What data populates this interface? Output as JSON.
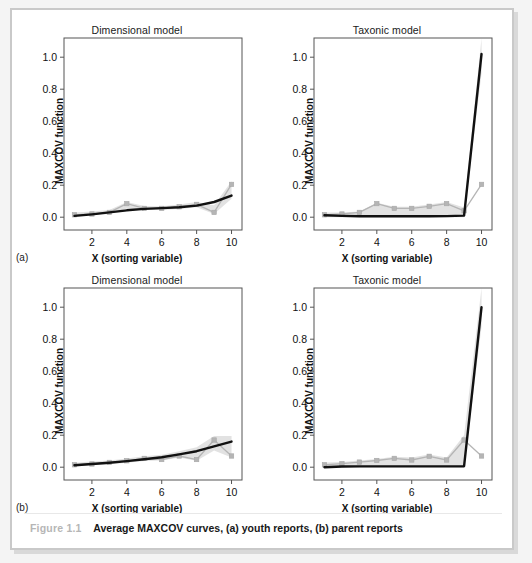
{
  "figure": {
    "number": "Figure 1.1",
    "caption": "Average MAXCOV curves, (a) youth reports, (b) parent reports",
    "panel_label_a": "(a)",
    "panel_label_b": "(b)"
  },
  "axes": {
    "ylabel": "MAXCOV function",
    "xlabel": "X (sorting variable)",
    "yticks": [
      "0.0",
      "0.2",
      "0.4",
      "0.6",
      "0.8",
      "1.0"
    ],
    "ytick_values": [
      0.0,
      0.2,
      0.4,
      0.6,
      0.8,
      1.0
    ],
    "xticks": [
      "2",
      "4",
      "6",
      "8",
      "10"
    ],
    "xtick_values": [
      2,
      4,
      6,
      8,
      10
    ],
    "xlim": [
      0.4,
      10.6
    ],
    "ylim": [
      -0.08,
      1.12
    ]
  },
  "colors": {
    "observed_line": "#b5b5b5",
    "model_line": "#111111",
    "band": "#dddddd",
    "frame": "#555555",
    "page_bg": "#f4f4f4",
    "sheet_bg": "#ffffff",
    "fig_number": "#b6b6b6"
  },
  "chart_data": [
    {
      "id": "a-dimensional",
      "type": "line",
      "title": "Dimensional model",
      "panel": "(a)",
      "xlabel": "X (sorting variable)",
      "ylabel": "MAXCOV function",
      "xlim": [
        0.4,
        10.6
      ],
      "ylim": [
        -0.08,
        1.12
      ],
      "grid": false,
      "legend": "none",
      "x": [
        1,
        2,
        3,
        4,
        5,
        6,
        7,
        8,
        9,
        10
      ],
      "series": [
        {
          "name": "Observed average MAXCOV curve",
          "style": "gray-line-with-square-markers",
          "values": [
            0.015,
            0.02,
            0.03,
            0.085,
            0.055,
            0.055,
            0.065,
            0.08,
            0.03,
            0.205
          ]
        },
        {
          "name": "Fitted dimensional model",
          "style": "black-line",
          "values": [
            0.008,
            0.018,
            0.03,
            0.043,
            0.052,
            0.057,
            0.062,
            0.072,
            0.095,
            0.135
          ]
        }
      ],
      "band": {
        "name": "confidence band",
        "upper": [
          0.03,
          0.035,
          0.045,
          0.095,
          0.07,
          0.068,
          0.08,
          0.095,
          0.075,
          0.225
        ],
        "lower": [
          0.005,
          0.012,
          0.02,
          0.055,
          0.045,
          0.045,
          0.052,
          0.062,
          0.02,
          0.115
        ]
      }
    },
    {
      "id": "a-taxonic",
      "type": "line",
      "title": "Taxonic model",
      "panel": "(a)",
      "xlabel": "X (sorting variable)",
      "ylabel": "MAXCOV function",
      "xlim": [
        0.4,
        10.6
      ],
      "ylim": [
        -0.08,
        1.12
      ],
      "grid": false,
      "legend": "none",
      "x": [
        1,
        2,
        3,
        4,
        5,
        6,
        7,
        8,
        9,
        10
      ],
      "series": [
        {
          "name": "Observed average MAXCOV curve",
          "style": "gray-line-with-square-markers",
          "values": [
            0.015,
            0.02,
            0.03,
            0.085,
            0.055,
            0.055,
            0.068,
            0.085,
            0.04,
            0.205
          ]
        },
        {
          "name": "Fitted taxonic model",
          "style": "black-line",
          "values": [
            0.012,
            0.008,
            0.006,
            0.006,
            0.006,
            0.006,
            0.006,
            0.007,
            0.01,
            1.02
          ]
        }
      ],
      "band": {
        "name": "confidence band",
        "upper": [
          0.03,
          0.03,
          0.035,
          0.09,
          0.065,
          0.065,
          0.08,
          0.095,
          0.06,
          1.12
        ],
        "lower": [
          0.0,
          0.0,
          0.0,
          0.0,
          0.0,
          0.0,
          0.0,
          0.0,
          0.0,
          0.9
        ]
      }
    },
    {
      "id": "b-dimensional",
      "type": "line",
      "title": "Dimensional model",
      "panel": "(b)",
      "xlabel": "X (sorting variable)",
      "ylabel": "MAXCOV function",
      "xlim": [
        0.4,
        10.6
      ],
      "ylim": [
        -0.08,
        1.12
      ],
      "grid": false,
      "legend": "none",
      "x": [
        1,
        2,
        3,
        4,
        5,
        6,
        7,
        8,
        9,
        10
      ],
      "series": [
        {
          "name": "Observed average MAXCOV curve",
          "style": "gray-line-with-square-markers",
          "values": [
            0.015,
            0.02,
            0.03,
            0.04,
            0.055,
            0.048,
            0.07,
            0.048,
            0.17,
            0.07
          ]
        },
        {
          "name": "Fitted dimensional model",
          "style": "black-line",
          "values": [
            0.012,
            0.02,
            0.028,
            0.038,
            0.05,
            0.062,
            0.08,
            0.1,
            0.13,
            0.16
          ]
        }
      ],
      "band": {
        "name": "confidence band",
        "upper": [
          0.028,
          0.035,
          0.042,
          0.055,
          0.068,
          0.078,
          0.1,
          0.125,
          0.195,
          0.195
        ],
        "lower": [
          0.005,
          0.012,
          0.018,
          0.028,
          0.038,
          0.042,
          0.06,
          0.04,
          0.105,
          0.06
        ]
      }
    },
    {
      "id": "b-taxonic",
      "type": "line",
      "title": "Taxonic model",
      "panel": "(b)",
      "xlabel": "X (sorting variable)",
      "ylabel": "MAXCOV function",
      "xlim": [
        0.4,
        10.6
      ],
      "ylim": [
        -0.08,
        1.12
      ],
      "grid": false,
      "legend": "none",
      "x": [
        1,
        2,
        3,
        4,
        5,
        6,
        7,
        8,
        9,
        10
      ],
      "series": [
        {
          "name": "Observed average MAXCOV curve",
          "style": "gray-line-with-square-markers",
          "values": [
            0.015,
            0.022,
            0.032,
            0.042,
            0.055,
            0.045,
            0.068,
            0.045,
            0.17,
            0.07
          ]
        },
        {
          "name": "Fitted taxonic model",
          "style": "black-line",
          "values": [
            0.0,
            0.004,
            0.005,
            0.005,
            0.005,
            0.005,
            0.005,
            0.005,
            0.006,
            1.0
          ]
        }
      ],
      "band": {
        "name": "confidence band",
        "upper": [
          0.03,
          0.032,
          0.042,
          0.052,
          0.065,
          0.06,
          0.08,
          0.06,
          0.2,
          1.12
        ],
        "lower": [
          0.0,
          0.0,
          0.0,
          0.0,
          0.0,
          0.0,
          0.0,
          0.0,
          0.0,
          0.88
        ]
      }
    }
  ]
}
